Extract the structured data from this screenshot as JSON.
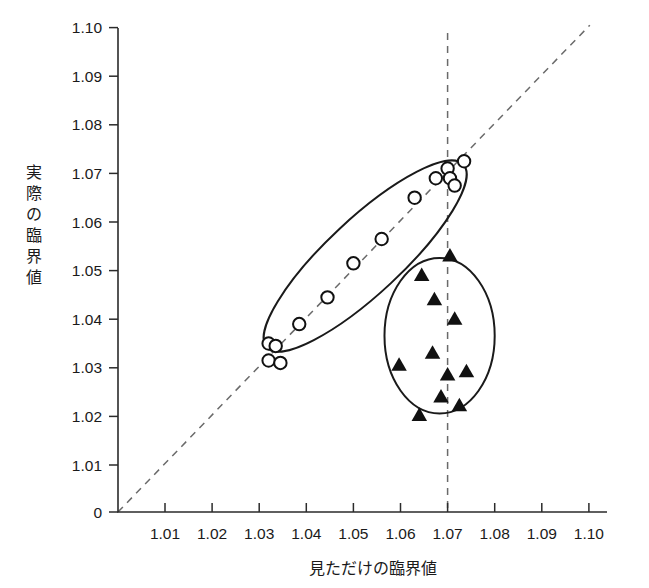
{
  "chart_data": {
    "type": "scatter",
    "title": "",
    "xlabel": "見ただけの臨界値",
    "ylabel": "実際の臨界値",
    "xlim": [
      1.0,
      1.105
    ],
    "ylim": [
      1.005,
      1.105
    ],
    "grid": false,
    "legend_position": "none",
    "x_tick_labels": [
      "1.01",
      "1.02",
      "1.03",
      "1.04",
      "1.05",
      "1.06",
      "1.07",
      "1.08",
      "1.09",
      "1.10"
    ],
    "x_tick_values": [
      1.01,
      1.02,
      1.03,
      1.04,
      1.05,
      1.06,
      1.07,
      1.08,
      1.09,
      1.1
    ],
    "y_tick_labels": [
      "0",
      "1.01",
      "1.02",
      "1.03",
      "1.04",
      "1.05",
      "1.06",
      "1.07",
      "1.08",
      "1.09",
      "1.10"
    ],
    "y_tick_values": [
      1.005,
      1.01,
      1.02,
      1.03,
      1.04,
      1.05,
      1.06,
      1.07,
      1.08,
      1.09,
      1.1
    ],
    "y_origin_label": "0",
    "series": [
      {
        "name": "open-circles",
        "marker": "circle-open",
        "color": "#111111",
        "points": [
          {
            "x": 1.032,
            "y": 1.035
          },
          {
            "x": 1.032,
            "y": 1.0315
          },
          {
            "x": 1.0335,
            "y": 1.0345
          },
          {
            "x": 1.0345,
            "y": 1.031
          },
          {
            "x": 1.0385,
            "y": 1.039
          },
          {
            "x": 1.0445,
            "y": 1.0445
          },
          {
            "x": 1.05,
            "y": 1.0515
          },
          {
            "x": 1.056,
            "y": 1.0565
          },
          {
            "x": 1.063,
            "y": 1.065
          },
          {
            "x": 1.0675,
            "y": 1.069
          },
          {
            "x": 1.07,
            "y": 1.071
          },
          {
            "x": 1.0705,
            "y": 1.069
          },
          {
            "x": 1.0715,
            "y": 1.0675
          },
          {
            "x": 1.0735,
            "y": 1.0725
          }
        ]
      },
      {
        "name": "filled-triangles",
        "marker": "triangle-filled",
        "color": "#111111",
        "points": [
          {
            "x": 1.0705,
            "y": 1.053
          },
          {
            "x": 1.0645,
            "y": 1.049
          },
          {
            "x": 1.0672,
            "y": 1.044
          },
          {
            "x": 1.0715,
            "y": 1.04
          },
          {
            "x": 1.0668,
            "y": 1.033
          },
          {
            "x": 1.0597,
            "y": 1.0305
          },
          {
            "x": 1.07,
            "y": 1.0285
          },
          {
            "x": 1.074,
            "y": 1.0292
          },
          {
            "x": 1.0686,
            "y": 1.024
          },
          {
            "x": 1.0725,
            "y": 1.0222
          },
          {
            "x": 1.064,
            "y": 1.0202
          }
        ]
      }
    ],
    "annotations": [
      {
        "name": "identity-line",
        "type": "dashed-diagonal",
        "from": {
          "x": 1.0,
          "y": 1.005
        },
        "to": {
          "x": 1.1002,
          "y": 1.1005
        }
      },
      {
        "name": "reference-line-x",
        "type": "dashed-vertical",
        "x": 1.07
      },
      {
        "name": "ellipse-accurate-group",
        "type": "ellipse",
        "cx": 1.0525,
        "cy": 1.053,
        "rx": 0.0285,
        "ry": 0.0077,
        "rotation_deg": -43
      },
      {
        "name": "ellipse-biased-group",
        "type": "ellipse",
        "cx": 1.0683,
        "cy": 1.0366,
        "rx": 0.0117,
        "ry": 0.016,
        "rotation_deg": 0
      }
    ]
  }
}
